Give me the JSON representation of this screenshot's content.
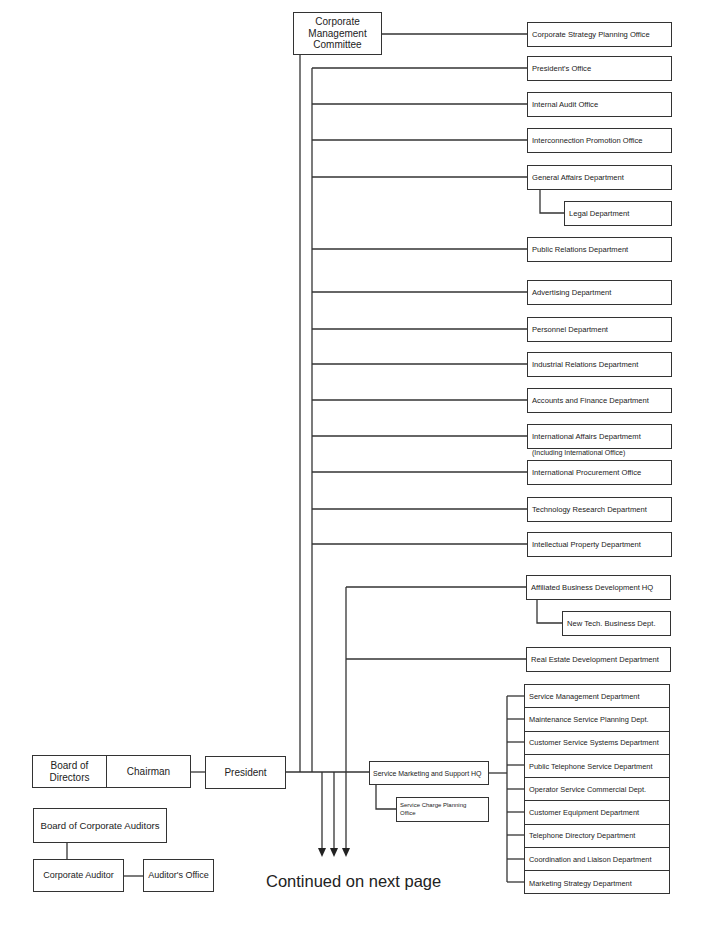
{
  "executive": {
    "corporate_management_committee": "Corporate\nManagement\nCommittee",
    "board_of_directors": "Board of\nDirectors",
    "chairman": "Chairman",
    "president": "President"
  },
  "audit": {
    "board_of_corporate_auditors": "Board of Corporate Auditors",
    "corporate_auditor": "Corporate Auditor",
    "auditors_office": "Auditor's Office"
  },
  "cmc_units": [
    {
      "label": "Corporate Strategy Planning Office"
    }
  ],
  "president_units": [
    {
      "label": "President's Office"
    },
    {
      "label": "Internal Audit Office"
    },
    {
      "label": "Interconnection Promotion Office"
    },
    {
      "label": "General Affairs Department",
      "sub": "Legal Department"
    },
    {
      "label": "Public Relations Department"
    },
    {
      "label": "Advertising Department"
    },
    {
      "label": "Personnel Department"
    },
    {
      "label": "Industrial Relations Department"
    },
    {
      "label": "Accounts and Finance Department"
    },
    {
      "label": "International Affairs Departmemt",
      "note": "(Including International Office)"
    },
    {
      "label": "International Procurement Office"
    },
    {
      "label": "Technology Research Department"
    },
    {
      "label": "Intellectual Property Department"
    }
  ],
  "business_units": [
    {
      "label": "Affiliated Business Development HQ",
      "sub": "New Tech. Business Dept."
    },
    {
      "label": "Real Estate Development Department"
    }
  ],
  "service_marketing": {
    "hq": "Service Marketing and Support HQ",
    "sub": "Service Charge Planning\nOffice",
    "departments": [
      "Service Management Department",
      "Maintenance Service Planning Dept.",
      "Customer Service Systems Department",
      "Public Telephone Service Department",
      "Operator Service Commercial Dept.",
      "Customer Equipment Department",
      "Telephone Directory Department",
      "Coordination and Liaison Department",
      "Marketing Strategy Department"
    ]
  },
  "footer": {
    "continued": "Continued on next page",
    "arrow_count": 3
  }
}
